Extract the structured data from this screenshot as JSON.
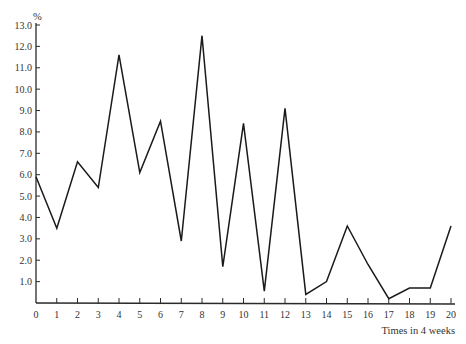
{
  "chart_data": {
    "type": "line",
    "title": "",
    "xlabel": "Times in 4 weeks",
    "ylabel": "%",
    "x": [
      0,
      1,
      2,
      3,
      4,
      5,
      6,
      7,
      8,
      9,
      10,
      11,
      12,
      13,
      14,
      15,
      16,
      17,
      18,
      19,
      20
    ],
    "series": [
      {
        "name": "",
        "values": [
          5.9,
          3.5,
          6.6,
          5.4,
          11.6,
          6.1,
          8.5,
          2.9,
          12.5,
          1.7,
          8.4,
          0.55,
          9.1,
          0.4,
          1.0,
          3.6,
          1.8,
          0.2,
          0.7,
          0.7,
          3.6
        ]
      }
    ],
    "xlim": [
      0,
      20
    ],
    "ylim": [
      0,
      13
    ],
    "x_ticks": [
      "0",
      "1",
      "2",
      "3",
      "4",
      "5",
      "6",
      "7",
      "8",
      "9",
      "10",
      "11",
      "12",
      "13",
      "14",
      "15",
      "16",
      "17",
      "18",
      "19",
      "20"
    ],
    "y_ticks": [
      "1.0",
      "2.0",
      "3.0",
      "4.0",
      "5.0",
      "6.0",
      "7.0",
      "8.0",
      "9.0",
      "10.0",
      "11.0",
      "12.0",
      "13.0"
    ],
    "grid": false,
    "legend": null
  },
  "axes": {
    "x_title": "Times in 4 weeks",
    "y_unit": "%"
  }
}
